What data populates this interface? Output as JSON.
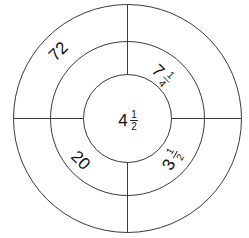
{
  "diagram": {
    "center": {
      "x": 127.5,
      "y": 118.5
    },
    "radii": {
      "outer": 114,
      "middle": 77,
      "inner": 44
    },
    "line_color": "#3a3a3a",
    "text_color": "#111111",
    "labels": {
      "outer_top_left": {
        "text": "72",
        "whole": "72"
      },
      "middle_top_right": {
        "text": "7 1/4",
        "whole": "7",
        "numerator": "1",
        "denominator": "4"
      },
      "center": {
        "text": "4 1/2",
        "whole": "4",
        "numerator": "1",
        "denominator": "2"
      },
      "middle_bottom_left": {
        "text": "20",
        "whole": "20"
      },
      "middle_bottom_right": {
        "text": "3 1/2",
        "whole": "3",
        "numerator": "1",
        "denominator": "2"
      }
    }
  }
}
